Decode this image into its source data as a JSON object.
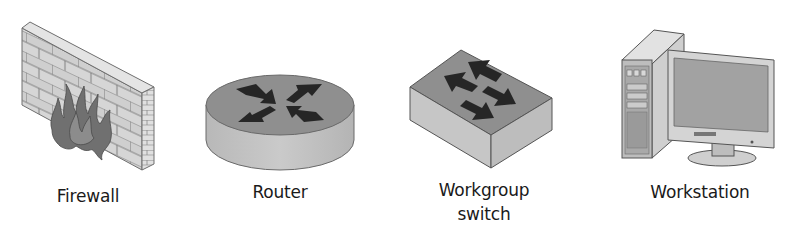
{
  "diagram": {
    "type": "network-device-legend",
    "colors": {
      "background": "#ffffff",
      "device_top": "#8e8e8e",
      "device_side": "#c4c4c4",
      "arrow": "#262626",
      "brick_face": "#d2d2d2",
      "flame": "#6e6e6e",
      "label_text": "#1a1a1a"
    },
    "nodes": [
      {
        "id": "firewall",
        "icon": "firewall-icon",
        "label_lines": [
          "Firewall"
        ]
      },
      {
        "id": "router",
        "icon": "router-icon",
        "label_lines": [
          "Router"
        ]
      },
      {
        "id": "workgroup-switch",
        "icon": "switch-icon",
        "label_lines": [
          "Workgroup",
          "switch"
        ]
      },
      {
        "id": "workstation",
        "icon": "workstation-icon",
        "label_lines": [
          "Workstation"
        ]
      }
    ]
  }
}
